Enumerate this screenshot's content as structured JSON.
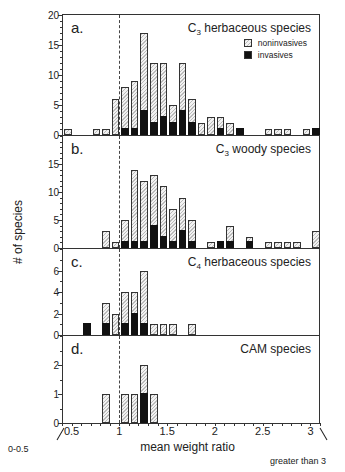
{
  "chart_data": [
    {
      "type": "bar",
      "stacked": true,
      "panel_label": "a.",
      "title": "C3 herbaceous species",
      "title_main": "C",
      "title_sub": "3",
      "title_rest": " herbaceous species",
      "ylim": [
        0,
        20
      ],
      "yticks": [
        0,
        5,
        10,
        15,
        20
      ],
      "legend": [
        "noninvasives",
        "invasives"
      ],
      "bins": [
        "0-0.5",
        "0.5-0.6",
        "0.6-0.7",
        "0.7-0.8",
        "0.8-0.9",
        "0.9-1.0",
        "1.0-1.1",
        "1.1-1.2",
        "1.2-1.3",
        "1.3-1.4",
        "1.4-1.5",
        "1.5-1.6",
        "1.6-1.7",
        "1.7-1.8",
        "1.8-1.9",
        "1.9-2.0",
        "2.0-2.1",
        "2.1-2.2",
        "2.2-2.3",
        "2.3-2.4",
        "2.4-2.5",
        "2.5-2.6",
        "2.6-2.7",
        "2.7-2.8",
        "2.8-2.9",
        "2.9-3.0",
        ">3"
      ],
      "series": [
        {
          "name": "total",
          "values": [
            1,
            0,
            0,
            1,
            1,
            6,
            8,
            9,
            17,
            12,
            12,
            5,
            12,
            6,
            2,
            3,
            3,
            2,
            1,
            0,
            0,
            1,
            1,
            1,
            0,
            1,
            1
          ]
        },
        {
          "name": "invasives",
          "values": [
            0,
            0,
            0,
            0,
            0,
            0,
            1,
            1,
            4,
            2,
            3,
            2,
            4,
            2,
            0,
            0,
            1,
            0,
            1,
            0,
            0,
            0,
            0,
            0,
            0,
            0,
            1
          ]
        }
      ]
    },
    {
      "type": "bar",
      "stacked": true,
      "panel_label": "b.",
      "title": "C3 woody species",
      "title_main": "C",
      "title_sub": "3",
      "title_rest": " woody species",
      "ylim": [
        0,
        20
      ],
      "yticks": [
        0,
        5,
        10,
        15
      ],
      "bins": [
        "0-0.5",
        "0.5-0.6",
        "0.6-0.7",
        "0.7-0.8",
        "0.8-0.9",
        "0.9-1.0",
        "1.0-1.1",
        "1.1-1.2",
        "1.2-1.3",
        "1.3-1.4",
        "1.4-1.5",
        "1.5-1.6",
        "1.6-1.7",
        "1.7-1.8",
        "1.8-1.9",
        "1.9-2.0",
        "2.0-2.1",
        "2.1-2.2",
        "2.2-2.3",
        "2.3-2.4",
        "2.4-2.5",
        "2.5-2.6",
        "2.6-2.7",
        "2.7-2.8",
        "2.8-2.9",
        "2.9-3.0",
        ">3"
      ],
      "series": [
        {
          "name": "total",
          "values": [
            0,
            0,
            0,
            0,
            3,
            1,
            5,
            14,
            12,
            13,
            11,
            7,
            9,
            5,
            0,
            1,
            1,
            4,
            0,
            2,
            0,
            1,
            1,
            1,
            1,
            0,
            3
          ]
        },
        {
          "name": "invasives",
          "values": [
            0,
            0,
            0,
            0,
            0,
            0,
            1,
            1,
            1,
            4,
            2,
            1,
            3,
            1,
            0,
            0,
            1,
            1,
            0,
            1,
            0,
            0,
            0,
            0,
            0,
            0,
            0
          ]
        }
      ]
    },
    {
      "type": "bar",
      "stacked": true,
      "panel_label": "c.",
      "title": "C4 herbaceous species",
      "title_main": "C",
      "title_sub": "4",
      "title_rest": " herbaceous species",
      "ylim": [
        0,
        8
      ],
      "yticks": [
        0,
        2,
        4,
        6
      ],
      "bins": [
        "0-0.5",
        "0.5-0.6",
        "0.6-0.7",
        "0.7-0.8",
        "0.8-0.9",
        "0.9-1.0",
        "1.0-1.1",
        "1.1-1.2",
        "1.2-1.3",
        "1.3-1.4",
        "1.4-1.5",
        "1.5-1.6",
        "1.6-1.7",
        "1.7-1.8",
        "1.8-1.9",
        "1.9-2.0",
        "2.0-2.1",
        "2.1-2.2",
        "2.2-2.3",
        "2.3-2.4",
        "2.4-2.5",
        "2.5-2.6",
        "2.6-2.7",
        "2.7-2.8",
        "2.8-2.9",
        "2.9-3.0",
        ">3"
      ],
      "series": [
        {
          "name": "total",
          "values": [
            0,
            0,
            1,
            0,
            3,
            2,
            4,
            4,
            6,
            1,
            1,
            1,
            0,
            1,
            0,
            0,
            0,
            0,
            0,
            0,
            0,
            0,
            0,
            0,
            0,
            0,
            0
          ]
        },
        {
          "name": "invasives",
          "values": [
            0,
            0,
            1,
            0,
            1,
            0,
            1,
            2,
            1,
            0,
            0,
            0,
            0,
            0,
            0,
            0,
            0,
            0,
            0,
            0,
            0,
            0,
            0,
            0,
            0,
            0,
            0
          ]
        }
      ]
    },
    {
      "type": "bar",
      "stacked": true,
      "panel_label": "d.",
      "title": "CAM species",
      "title_main": "CAM species",
      "title_sub": "",
      "title_rest": "",
      "ylim": [
        0,
        3
      ],
      "yticks": [
        0,
        1,
        2
      ],
      "bins": [
        "0-0.5",
        "0.5-0.6",
        "0.6-0.7",
        "0.7-0.8",
        "0.8-0.9",
        "0.9-1.0",
        "1.0-1.1",
        "1.1-1.2",
        "1.2-1.3",
        "1.3-1.4",
        "1.4-1.5",
        "1.5-1.6",
        "1.6-1.7",
        "1.7-1.8",
        "1.8-1.9",
        "1.9-2.0",
        "2.0-2.1",
        "2.1-2.2",
        "2.2-2.3",
        "2.3-2.4",
        "2.4-2.5",
        "2.5-2.6",
        "2.6-2.7",
        "2.7-2.8",
        "2.8-2.9",
        "2.9-3.0",
        ">3"
      ],
      "series": [
        {
          "name": "total",
          "values": [
            0,
            0,
            0,
            0,
            1,
            0,
            1,
            1,
            2,
            1,
            0,
            0,
            0,
            0,
            0,
            0,
            0,
            0,
            0,
            0,
            0,
            0,
            0,
            0,
            0,
            0,
            0
          ]
        },
        {
          "name": "invasives",
          "values": [
            0,
            0,
            0,
            0,
            0,
            0,
            0,
            0,
            1,
            0,
            0,
            0,
            0,
            0,
            0,
            0,
            0,
            0,
            0,
            0,
            0,
            0,
            0,
            0,
            0,
            0,
            0
          ]
        }
      ]
    }
  ],
  "axes": {
    "xlabel": "mean weight ratio",
    "ylabel": "# of species",
    "xticks": [
      "0.5",
      "1",
      "1.5",
      "2",
      "2.5",
      "3"
    ],
    "reference_line": 1,
    "annotation_left": "0-0.5",
    "annotation_right": "greater than 3"
  },
  "legend": {
    "noninvasives": "noninvasives",
    "invasives": "invasives"
  },
  "colors": {
    "invasive": "#111111",
    "noninvasive_hatch": "#bbbbbb",
    "axis": "#333333"
  }
}
